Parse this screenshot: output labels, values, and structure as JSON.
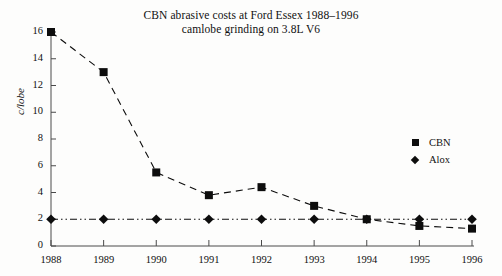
{
  "chart_data": {
    "type": "line",
    "title": "CBN abrasive costs at Ford Essex 1988–1996",
    "subtitle": "camlobe grinding on 3.8L V6",
    "xlabel": "",
    "ylabel": "c/lobe",
    "categories": [
      "1988",
      "1989",
      "1990",
      "1991",
      "1992",
      "1993",
      "1994",
      "1995",
      "1996"
    ],
    "series": [
      {
        "name": "CBN",
        "marker": "square",
        "linestyle": "dashed",
        "color": "#0d0d0d",
        "values": [
          16.0,
          13.0,
          5.5,
          3.8,
          4.4,
          3.0,
          2.0,
          1.5,
          1.3
        ]
      },
      {
        "name": "Alox",
        "marker": "diamond",
        "linestyle": "dashdot",
        "color": "#0d0d0d",
        "values": [
          2.0,
          2.0,
          2.0,
          2.0,
          2.0,
          2.0,
          2.0,
          2.0,
          2.0
        ]
      }
    ],
    "ylim": [
      0,
      16
    ],
    "yticks": [
      0,
      2,
      4,
      6,
      8,
      10,
      12,
      14,
      16
    ],
    "ytick_labels": [
      "0",
      "2",
      "4",
      "6",
      "8",
      "10",
      "12",
      "14",
      "16"
    ],
    "grid": false,
    "legend_position": "right",
    "legend_entries": [
      "CBN",
      "Alox"
    ]
  },
  "legend": {
    "cbn_label": "CBN",
    "alox_label": "Alox"
  }
}
